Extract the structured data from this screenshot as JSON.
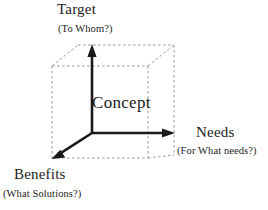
{
  "figure": {
    "background_color": "#ffffff",
    "line_color": "#1a1a1a",
    "dashed_edge_color": "#9a9a9a"
  },
  "center": {
    "label": "Concept"
  },
  "axes": [
    {
      "id": "vertical",
      "name": "Target",
      "main_label": "Target",
      "sub_label": "(To Whom?)",
      "direction": "up",
      "origin": [
        92,
        133
      ],
      "tip": [
        92,
        46
      ]
    },
    {
      "id": "horizontal",
      "name": "Needs",
      "main_label": "Needs",
      "sub_label": "(For What needs?)",
      "direction": "right",
      "origin": [
        92,
        133
      ],
      "tip": [
        174,
        133
      ]
    },
    {
      "id": "depth",
      "name": "Benefits",
      "main_label": "Benefits",
      "sub_label": "(What Solutions?)",
      "direction": "down-left",
      "origin": [
        92,
        133
      ],
      "tip": [
        53,
        158
      ]
    }
  ],
  "cube": {
    "front_top_left": [
      52,
      66
    ],
    "front_top_right": [
      148,
      66
    ],
    "front_bottom_left": [
      52,
      158
    ],
    "front_bottom_right": [
      148,
      158
    ],
    "back_top_left": [
      78,
      45
    ],
    "back_top_right": [
      174,
      45
    ],
    "back_bottom_right": [
      174,
      155
    ]
  }
}
